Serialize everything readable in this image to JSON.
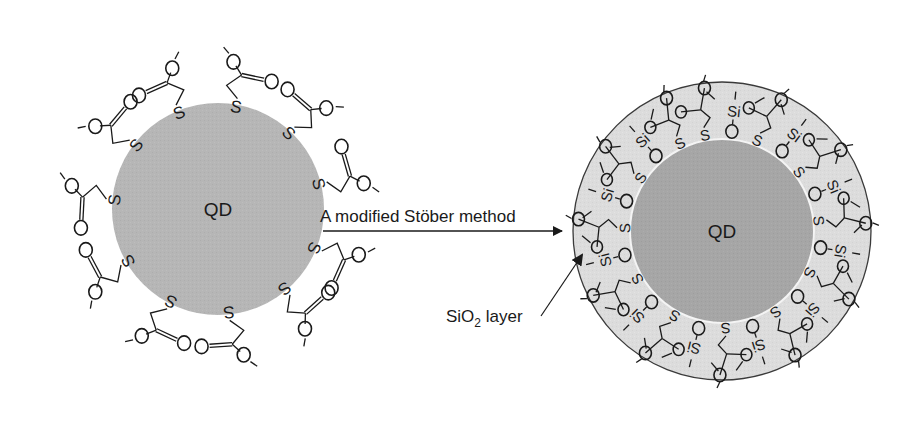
{
  "diagram": {
    "colors": {
      "left_core": "#b6b6b6",
      "right_core": "#a6a6a6",
      "shell": "#dcdcdc",
      "shell_outline": "#3a3a3a",
      "ink": "#1a1a1a",
      "background": "#ffffff"
    },
    "left_particle": {
      "core_label": "QD",
      "ligand": {
        "anchor_atom": "S",
        "carbonyl_atom": "O",
        "terminal_atom": "O",
        "terminal_charge": "−",
        "formula": "S–CH2–C(=O)–O−"
      },
      "ligand_count": 11
    },
    "process_arrow": {
      "label": "A modified Stöber method"
    },
    "right_particle": {
      "core_label": "QD",
      "shell_label": "SiO",
      "shell_label_subscript": "2",
      "shell_label_suffix": " layer",
      "linker_atoms": {
        "thiol": "S",
        "oxygen": "O",
        "silicon": "Si"
      },
      "thiol_ligand_count": 12,
      "silanol_group_count": 11
    }
  }
}
